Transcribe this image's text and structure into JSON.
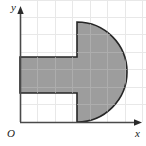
{
  "figure": {
    "title": "",
    "axes": {
      "y_label": "y",
      "x_label": "x",
      "origin_label": "O"
    },
    "colors": {
      "background": "#ffffff",
      "grid": "#e8e8e8",
      "axis": "#4a4a4a",
      "shape_fill": "#9d9d9d",
      "shape_stroke": "#262626",
      "label": "#1a1a1a"
    },
    "grid": {
      "spacing_px": 17.5,
      "origin_x_px": 20,
      "origin_y_px": 122,
      "vertical_lines": 8,
      "horizontal_lines": 7,
      "visible": true
    },
    "shape": {
      "type": "rectangle-with-semicircle",
      "description": "shaded plug shape: a horizontal rectangle joined to a right-facing semicircle",
      "rectangle": {
        "left_px": 20,
        "top_px": 57,
        "right_px": 77,
        "bottom_px": 93,
        "width_units": 3.3,
        "height_units": 2.0
      },
      "semicircle": {
        "flat_side_x_px": 77,
        "top_px": 22,
        "bottom_px": 122,
        "rightmost_px": 127,
        "center_y_px": 72,
        "radius_px": 50,
        "diameter_units": 5.7
      }
    }
  }
}
